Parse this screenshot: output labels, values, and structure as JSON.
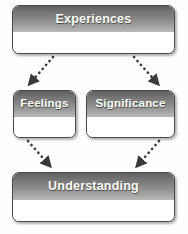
{
  "diagram": {
    "type": "flowchart",
    "background_color": "#fefefe",
    "node_header_color_top": "#5e5e5e",
    "node_header_color_bottom": "#b9b9b9",
    "node_body_color": "#ffffff",
    "node_border_color": "#4a4a4a",
    "node_label_color": "#ffffff",
    "arrow_color": "#3a3a3a",
    "arrow_style": "dotted",
    "nodes": [
      {
        "id": "experiences",
        "label": "Experiences",
        "level": "top"
      },
      {
        "id": "feelings",
        "label": "Feelings",
        "level": "middle-left"
      },
      {
        "id": "significance",
        "label": "Significance",
        "level": "middle-right"
      },
      {
        "id": "understanding",
        "label": "Understanding",
        "level": "bottom"
      }
    ],
    "edges": [
      {
        "id": "experiences-to-feelings",
        "from": "Experiences",
        "to": "Feelings",
        "direction": "down-left"
      },
      {
        "id": "experiences-to-significance",
        "from": "Experiences",
        "to": "Significance",
        "direction": "down-right"
      },
      {
        "id": "feelings-to-understanding",
        "from": "Feelings",
        "to": "Understanding",
        "direction": "down-right"
      },
      {
        "id": "significance-to-understanding",
        "from": "Significance",
        "to": "Understanding",
        "direction": "down-left"
      }
    ]
  }
}
